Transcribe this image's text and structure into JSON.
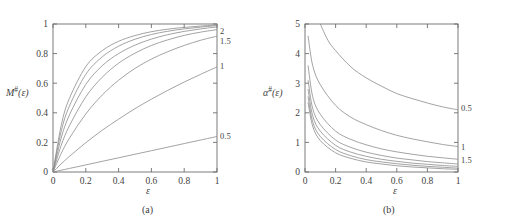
{
  "figure": {
    "panels": [
      {
        "id": "a",
        "caption": "(a)",
        "ylabel_main": "M",
        "ylabel_sup": "#",
        "ylabel_arg": "(ε)",
        "xlabel": "ε",
        "x_ticks": [
          "0",
          "0.2",
          "0.4",
          "0.6",
          "0.8",
          "1"
        ],
        "y_ticks": [
          "0",
          "0.2",
          "0.4",
          "0.6",
          "0.8",
          "1"
        ],
        "curve_labels": [
          "2",
          "1.5",
          "1",
          "0.5"
        ]
      },
      {
        "id": "b",
        "caption": "(b)",
        "ylabel_main": "α",
        "ylabel_sup": "#",
        "ylabel_arg": "(ε)",
        "xlabel": "ε",
        "x_ticks": [
          "0",
          "0.2",
          "0.4",
          "0.6",
          "0.8",
          "1"
        ],
        "y_ticks": [
          "0",
          "1",
          "2",
          "3",
          "4",
          "5"
        ],
        "curve_labels": [
          "0.5",
          "1",
          "1.5"
        ]
      }
    ]
  },
  "chart_data": [
    {
      "type": "line",
      "panel": "a",
      "title": "",
      "xlabel": "ε",
      "ylabel": "M#(ε)",
      "xlim": [
        0,
        1
      ],
      "ylim": [
        0,
        1
      ],
      "xticks": [
        0,
        0.2,
        0.4,
        0.6,
        0.8,
        1
      ],
      "yticks": [
        0,
        0.2,
        0.4,
        0.6,
        0.8,
        1
      ],
      "grid": false,
      "legend_position": "inline-right-edge",
      "annotations": [
        {
          "text": "2",
          "x": 1.0,
          "y": 0.955
        },
        {
          "text": "1.5",
          "x": 1.0,
          "y": 0.885
        },
        {
          "text": "1",
          "x": 1.0,
          "y": 0.715
        },
        {
          "text": "0.5",
          "x": 1.0,
          "y": 0.245
        }
      ],
      "series": [
        {
          "name": "0.5",
          "x": [
            0,
            0.05,
            0.1,
            0.2,
            0.3,
            0.4,
            0.5,
            0.6,
            0.7,
            0.8,
            0.9,
            1.0
          ],
          "values": [
            0,
            0.012,
            0.024,
            0.048,
            0.072,
            0.096,
            0.12,
            0.144,
            0.168,
            0.192,
            0.216,
            0.24
          ]
        },
        {
          "name": "1",
          "x": [
            0,
            0.05,
            0.1,
            0.2,
            0.3,
            0.4,
            0.5,
            0.6,
            0.7,
            0.8,
            0.9,
            1.0
          ],
          "values": [
            0,
            0.055,
            0.105,
            0.198,
            0.282,
            0.357,
            0.428,
            0.492,
            0.552,
            0.608,
            0.66,
            0.71
          ]
        },
        {
          "name": "1.5",
          "x": [
            0,
            0.05,
            0.1,
            0.2,
            0.3,
            0.4,
            0.5,
            0.6,
            0.7,
            0.8,
            0.9,
            1.0
          ],
          "values": [
            0,
            0.125,
            0.228,
            0.392,
            0.52,
            0.62,
            0.7,
            0.763,
            0.813,
            0.855,
            0.89,
            0.918
          ]
        },
        {
          "name": "2",
          "x": [
            0,
            0.05,
            0.1,
            0.2,
            0.3,
            0.4,
            0.5,
            0.6,
            0.7,
            0.8,
            0.9,
            1.0
          ],
          "values": [
            0,
            0.18,
            0.312,
            0.508,
            0.64,
            0.735,
            0.803,
            0.855,
            0.893,
            0.923,
            0.945,
            0.962
          ]
        },
        {
          "name": "unlabeled-1",
          "x": [
            0,
            0.05,
            0.1,
            0.2,
            0.3,
            0.4,
            0.5,
            0.6,
            0.7,
            0.8,
            0.9,
            1.0
          ],
          "values": [
            0,
            0.23,
            0.385,
            0.592,
            0.718,
            0.8,
            0.857,
            0.898,
            0.928,
            0.95,
            0.967,
            0.98
          ]
        },
        {
          "name": "unlabeled-2",
          "x": [
            0,
            0.05,
            0.1,
            0.2,
            0.3,
            0.4,
            0.5,
            0.6,
            0.7,
            0.8,
            0.9,
            1.0
          ],
          "values": [
            0,
            0.275,
            0.445,
            0.66,
            0.778,
            0.85,
            0.897,
            0.929,
            0.951,
            0.967,
            0.979,
            0.989
          ]
        },
        {
          "name": "unlabeled-3",
          "x": [
            0,
            0.05,
            0.1,
            0.2,
            0.3,
            0.4,
            0.5,
            0.6,
            0.7,
            0.8,
            0.9,
            1.0
          ],
          "values": [
            0,
            0.315,
            0.497,
            0.712,
            0.82,
            0.883,
            0.922,
            0.948,
            0.965,
            0.977,
            0.986,
            0.994
          ]
        }
      ]
    },
    {
      "type": "line",
      "panel": "b",
      "title": "",
      "xlabel": "ε",
      "ylabel": "α#(ε)",
      "xlim": [
        0,
        1
      ],
      "ylim": [
        0,
        5
      ],
      "xticks": [
        0,
        0.2,
        0.4,
        0.6,
        0.8,
        1
      ],
      "yticks": [
        0,
        1,
        2,
        3,
        4,
        5
      ],
      "grid": false,
      "legend_position": "inline-right-edge",
      "annotations": [
        {
          "text": "0.5",
          "x": 1.0,
          "y": 2.15
        },
        {
          "text": "1",
          "x": 1.0,
          "y": 0.85
        },
        {
          "text": "1.5",
          "x": 1.0,
          "y": 0.42
        }
      ],
      "series": [
        {
          "name": "0.5",
          "x": [
            0.1,
            0.15,
            0.2,
            0.3,
            0.4,
            0.5,
            0.6,
            0.7,
            0.8,
            0.9,
            1.0
          ],
          "values": [
            5.0,
            4.45,
            4.1,
            3.55,
            3.18,
            2.9,
            2.65,
            2.48,
            2.33,
            2.2,
            2.1
          ]
        },
        {
          "name": "1",
          "x": [
            0.02,
            0.05,
            0.1,
            0.2,
            0.3,
            0.4,
            0.5,
            0.6,
            0.7,
            0.8,
            0.9,
            1.0
          ],
          "values": [
            4.6,
            3.6,
            2.95,
            2.25,
            1.85,
            1.6,
            1.4,
            1.24,
            1.12,
            1.02,
            0.93,
            0.86
          ]
        },
        {
          "name": "1.5",
          "x": [
            0.02,
            0.05,
            0.1,
            0.2,
            0.3,
            0.4,
            0.5,
            0.6,
            0.7,
            0.8,
            0.9,
            1.0
          ],
          "values": [
            3.6,
            2.55,
            1.95,
            1.38,
            1.1,
            0.92,
            0.78,
            0.68,
            0.6,
            0.53,
            0.48,
            0.43
          ]
        },
        {
          "name": "unlabeled-1",
          "x": [
            0.02,
            0.05,
            0.1,
            0.2,
            0.3,
            0.4,
            0.5,
            0.6,
            0.7,
            0.8,
            0.9,
            1.0
          ],
          "values": [
            3.1,
            2.15,
            1.6,
            1.08,
            0.83,
            0.67,
            0.56,
            0.47,
            0.41,
            0.35,
            0.31,
            0.27
          ]
        },
        {
          "name": "unlabeled-2",
          "x": [
            0.02,
            0.05,
            0.1,
            0.2,
            0.3,
            0.4,
            0.5,
            0.6,
            0.7,
            0.8,
            0.9,
            1.0
          ],
          "values": [
            2.8,
            1.9,
            1.38,
            0.9,
            0.67,
            0.53,
            0.43,
            0.36,
            0.3,
            0.26,
            0.22,
            0.19
          ]
        },
        {
          "name": "unlabeled-3",
          "x": [
            0.02,
            0.05,
            0.1,
            0.2,
            0.3,
            0.4,
            0.5,
            0.6,
            0.7,
            0.8,
            0.9,
            1.0
          ],
          "values": [
            2.55,
            1.7,
            1.2,
            0.76,
            0.55,
            0.42,
            0.34,
            0.28,
            0.23,
            0.19,
            0.16,
            0.13
          ]
        },
        {
          "name": "unlabeled-4",
          "x": [
            0.02,
            0.05,
            0.1,
            0.2,
            0.3,
            0.4,
            0.5,
            0.6,
            0.7,
            0.8,
            0.9,
            1.0
          ],
          "values": [
            2.35,
            1.55,
            1.06,
            0.65,
            0.46,
            0.34,
            0.27,
            0.21,
            0.17,
            0.14,
            0.11,
            0.09
          ]
        }
      ]
    }
  ],
  "style": {
    "curve_color": "#8c8c8c",
    "axis_color": "#6e6e6e",
    "text_color": "#3f3f3f"
  }
}
